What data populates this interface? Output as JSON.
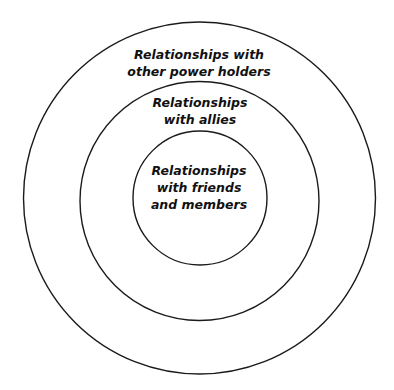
{
  "diagram": {
    "type": "concentric-circles",
    "colors": {
      "stroke": "#1a1a1a",
      "background": "#ffffff",
      "text": "#111111"
    },
    "rings": [
      {
        "name": "outer",
        "cx": 199.5,
        "cy": 198,
        "r": 176,
        "lines": [
          "Relationships with",
          "other power holders"
        ]
      },
      {
        "name": "middle",
        "cx": 199.5,
        "cy": 201,
        "r": 119.5,
        "lines": [
          "Relationships",
          "with allies"
        ]
      },
      {
        "name": "inner",
        "cx": 200,
        "cy": 198,
        "r": 67,
        "lines": [
          "Relationships",
          "with friends",
          "and members"
        ]
      }
    ]
  }
}
